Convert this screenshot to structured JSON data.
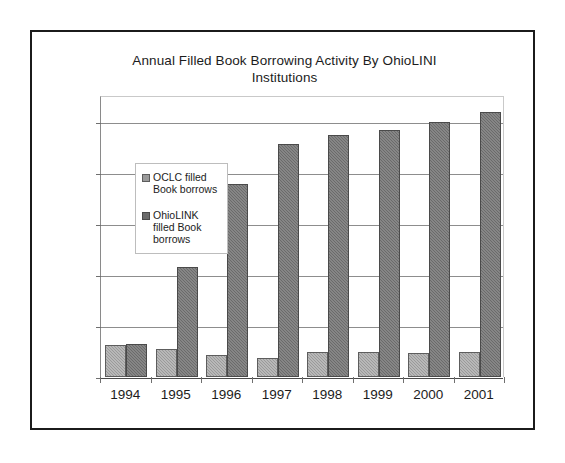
{
  "chart_data": {
    "type": "bar",
    "title": "Annual Filled Book Borrowing Activity By OhioLINI Institutions",
    "title_line1": "Annual Filled Book Borrowing Activity By OhioLINI",
    "title_line2": "Institutions",
    "xlabel": "",
    "ylabel": "",
    "categories": [
      "1994",
      "1995",
      "1996",
      "1997",
      "1998",
      "1999",
      "2000",
      "2001"
    ],
    "series": [
      {
        "name": "OCLC filled Book borrows",
        "color": "#9a9a9a",
        "values": [
          63000,
          55000,
          43000,
          38000,
          48000,
          48000,
          47000,
          49000
        ]
      },
      {
        "name": "OhioLINK filled Book borrows",
        "color": "#6b6b6b",
        "values": [
          64000,
          215000,
          377000,
          456000,
          474000,
          484000,
          500000,
          519000
        ]
      }
    ],
    "ylim": [
      0,
      550000
    ],
    "y_ticks": [
      0,
      100000,
      200000,
      300000,
      400000,
      500000
    ],
    "y_tick_labels": [
      "0",
      "100,000",
      "200,000",
      "300,000",
      "400,000",
      "500,000"
    ],
    "grid": true,
    "legend_position": "inside-top-left"
  },
  "legend": {
    "items": [
      {
        "label_line1": "OCLC filled Book",
        "label_line2": "borrows",
        "swatch": "oclc"
      },
      {
        "label_line1": "OhioLINK filled",
        "label_line2": "Book borrows",
        "swatch": "ohiolink"
      }
    ]
  }
}
